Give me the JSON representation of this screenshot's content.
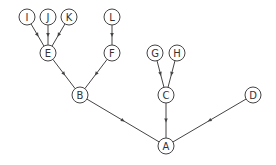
{
  "diagram": {
    "type": "directed-tree",
    "colors": {
      "stroke": "#444444",
      "node_fill": "#ffffff",
      "text": "#333333",
      "background": "#ffffff"
    },
    "node_radius": 8,
    "nodes": [
      {
        "id": "A",
        "label": "A",
        "x": 166,
        "y": 146
      },
      {
        "id": "B",
        "label": "B",
        "x": 80,
        "y": 95
      },
      {
        "id": "C",
        "label": "C",
        "x": 166,
        "y": 95
      },
      {
        "id": "D",
        "label": "D",
        "x": 253,
        "y": 95
      },
      {
        "id": "E",
        "label": "E",
        "x": 48,
        "y": 53
      },
      {
        "id": "F",
        "label": "F",
        "x": 112,
        "y": 53
      },
      {
        "id": "G",
        "label": "G",
        "x": 155,
        "y": 53
      },
      {
        "id": "H",
        "label": "H",
        "x": 177,
        "y": 53
      },
      {
        "id": "I",
        "label": "I",
        "x": 27,
        "y": 17
      },
      {
        "id": "J",
        "label": "J",
        "x": 48,
        "y": 17
      },
      {
        "id": "K",
        "label": "K",
        "x": 69,
        "y": 17
      },
      {
        "id": "L",
        "label": "L",
        "x": 112,
        "y": 17
      }
    ],
    "edges": [
      {
        "from": "I",
        "to": "E"
      },
      {
        "from": "J",
        "to": "E"
      },
      {
        "from": "K",
        "to": "E"
      },
      {
        "from": "L",
        "to": "F"
      },
      {
        "from": "E",
        "to": "B"
      },
      {
        "from": "F",
        "to": "B"
      },
      {
        "from": "G",
        "to": "C"
      },
      {
        "from": "H",
        "to": "C"
      },
      {
        "from": "B",
        "to": "A"
      },
      {
        "from": "C",
        "to": "A"
      },
      {
        "from": "D",
        "to": "A"
      }
    ]
  }
}
